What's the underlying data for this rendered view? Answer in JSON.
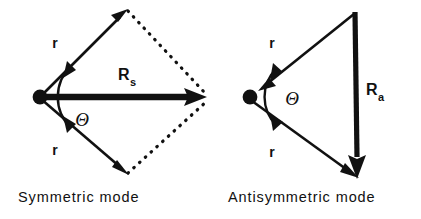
{
  "figure": {
    "ink_color": "#111111",
    "background_color": "#ffffff"
  },
  "panels": [
    {
      "id": "symmetric",
      "caption": "Symmetric mode",
      "vertex_dot": {
        "cx": 40,
        "cy": 97,
        "r": 7
      },
      "resultant": {
        "label_main": "R",
        "label_sub": "s",
        "label_x": 118,
        "label_y": 80,
        "sub_x": 131,
        "sub_y": 86,
        "from": [
          40,
          97
        ],
        "to": [
          205,
          97
        ],
        "style": "thick-solid",
        "direction": "outward"
      },
      "arms": [
        {
          "label": "r",
          "label_x": 55,
          "label_y": 48,
          "from": [
            40,
            97
          ],
          "to": [
            125,
            12
          ],
          "style": "solid",
          "direction": "outward"
        },
        {
          "label": "r",
          "label_x": 55,
          "label_y": 155,
          "from": [
            40,
            97
          ],
          "to": [
            125,
            172
          ],
          "style": "solid",
          "direction": "outward"
        }
      ],
      "closure_lines": [
        {
          "from": [
            125,
            12
          ],
          "to": [
            205,
            97
          ],
          "style": "dotted"
        },
        {
          "from": [
            125,
            172
          ],
          "to": [
            205,
            97
          ],
          "style": "dotted"
        }
      ],
      "angle_marker": {
        "label": "Θ",
        "label_x": 82,
        "label_y": 126,
        "arc_radius": 43,
        "center": [
          40,
          97
        ],
        "double_headed": true
      }
    },
    {
      "id": "antisymmetric",
      "caption": "Antisymmetric mode",
      "vertex_dot": {
        "cx": 250,
        "cy": 97,
        "r": 7
      },
      "resultant": {
        "label_main": "R",
        "label_sub": "a",
        "label_x": 366,
        "label_y": 95,
        "sub_x": 379,
        "sub_y": 101,
        "from": [
          355,
          12
        ],
        "to": [
          357,
          175
        ],
        "style": "thick-solid",
        "direction": "downward"
      },
      "arms": [
        {
          "label": "r",
          "label_x": 272,
          "label_y": 48,
          "from": [
            355,
            12
          ],
          "to": [
            250,
            97
          ],
          "style": "solid",
          "direction": "inward"
        },
        {
          "label": "r",
          "label_x": 272,
          "label_y": 157,
          "from": [
            250,
            97
          ],
          "to": [
            357,
            175
          ],
          "style": "solid",
          "direction": "outward"
        }
      ],
      "closure_lines": [],
      "angle_marker": {
        "label": "Θ",
        "label_x": 292,
        "label_y": 105,
        "arc_radius": 40,
        "center": [
          250,
          97
        ],
        "double_headed": true
      }
    }
  ]
}
